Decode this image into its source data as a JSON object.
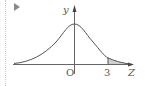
{
  "diagram": {
    "type": "normal-distribution-curve",
    "axes": {
      "y_label": "y",
      "x_label": "Z",
      "origin_label": "O"
    },
    "tick_labels": [
      "3"
    ],
    "shaded_region": "Z > 3 (right tail)",
    "colors": {
      "curve": "#555555",
      "axis": "#666666",
      "shade": "#c8c8c8",
      "marker": "#8a8a8a"
    }
  }
}
